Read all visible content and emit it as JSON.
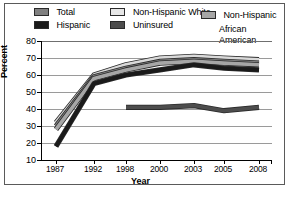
{
  "chart_data": {
    "type": "line",
    "title": "",
    "xlabel": "Year",
    "ylabel": "Percent",
    "categories": [
      "1987",
      "1992",
      "1998",
      "2000",
      "2003",
      "2005",
      "2008"
    ],
    "x_tick_labels": [
      "1987",
      "1992",
      "1998",
      "2000",
      "2003",
      "2005",
      "2008"
    ],
    "y_tick_labels": [
      "10",
      "20",
      "30",
      "40",
      "50",
      "60",
      "70",
      "80"
    ],
    "y_ticks": [
      10,
      20,
      30,
      40,
      50,
      60,
      70,
      80
    ],
    "ylim": [
      10,
      80
    ],
    "grid": true,
    "legend_position": "top",
    "series": [
      {
        "name": "Total",
        "color": "#808080",
        "values": [
          30,
          59,
          64,
          68,
          69,
          68,
          67
        ]
      },
      {
        "name": "Non-Hispanic White",
        "color": "#d9d9d9",
        "values": [
          32,
          60,
          66,
          70,
          71,
          70,
          69
        ]
      },
      {
        "name": "Non-Hispanic African American",
        "color": "#a6a6a6",
        "values": [
          28,
          58,
          63,
          67,
          68,
          67,
          66
        ]
      },
      {
        "name": "Hispanic",
        "color": "#1a1a1a",
        "values": [
          18,
          55,
          60,
          63,
          66,
          64,
          63
        ]
      },
      {
        "name": "Uninsured",
        "color": "#4d4d4d",
        "values": [
          null,
          null,
          41,
          41,
          42,
          39,
          41
        ]
      }
    ]
  },
  "legend": {
    "row1": [
      {
        "label": "Total",
        "swatch_color": "#808080",
        "icon": "legend-swatch-icon"
      },
      {
        "label": "Non-Hispanic White",
        "swatch_color": "#e6e6e6",
        "icon": "legend-swatch-icon"
      }
    ],
    "row2": [
      {
        "label": "Hispanic",
        "swatch_color": "#1a1a1a",
        "icon": "legend-swatch-icon"
      },
      {
        "label": "Uninsured",
        "swatch_color": "#4d4d4d",
        "icon": "legend-swatch-icon"
      }
    ],
    "col3": {
      "line1": "Non-Hispanic",
      "line2": "African American",
      "swatch_color": "#a6a6a6",
      "icon": "legend-swatch-icon"
    }
  },
  "axes": {
    "y_axis_title": "Percent",
    "x_axis_title": "Year"
  }
}
